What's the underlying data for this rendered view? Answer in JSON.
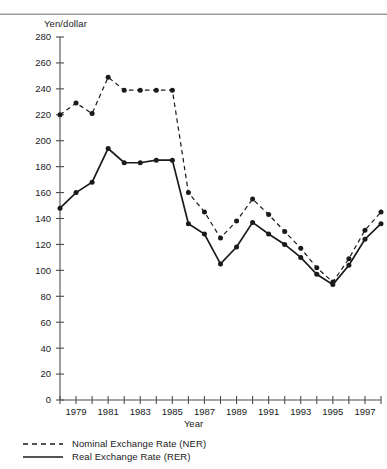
{
  "axes": {
    "ylabel": "Yen/dollar",
    "xlabel": "Year",
    "yticks": [
      "280",
      "260",
      "240",
      "220",
      "200",
      "180",
      "160",
      "140",
      "120",
      "100",
      "80",
      "60",
      "40",
      "20",
      "0"
    ],
    "xticks": [
      "1979",
      "1981",
      "1983",
      "1985",
      "1987",
      "1989",
      "1991",
      "1993",
      "1995",
      "1997"
    ]
  },
  "legend": {
    "items": [
      {
        "label": "Nominal Exchange Rate (NER)",
        "style": "dashed",
        "color": "#1a1a1a"
      },
      {
        "label": "Real Exchange Rate (RER)",
        "style": "solid",
        "color": "#1a1a1a"
      }
    ]
  },
  "chart_data": {
    "type": "line",
    "title": "",
    "xlabel": "Year",
    "ylabel": "Yen/dollar",
    "xlim": [
      1978,
      1998
    ],
    "ylim": [
      0,
      280
    ],
    "ytick_step": 20,
    "xtick_step": 1,
    "xtick_labels_every": 2,
    "grid": false,
    "legend_position": "bottom-left",
    "x": [
      1978,
      1979,
      1980,
      1981,
      1982,
      1983,
      1984,
      1985,
      1986,
      1987,
      1988,
      1989,
      1990,
      1991,
      1992,
      1993,
      1994,
      1995,
      1996,
      1997,
      1998
    ],
    "series": [
      {
        "name": "Nominal Exchange Rate (NER)",
        "style": "dashed",
        "color": "#1a1a1a",
        "values": [
          220,
          229,
          221,
          249,
          239,
          239,
          239,
          239,
          160,
          145,
          125,
          138,
          155,
          143,
          130,
          117,
          102,
          91,
          109,
          131,
          145
        ]
      },
      {
        "name": "Real Exchange Rate (RER)",
        "style": "solid",
        "color": "#1a1a1a",
        "values": [
          148,
          160,
          168,
          194,
          183,
          183,
          185,
          185,
          136,
          128,
          105,
          118,
          137,
          128,
          120,
          110,
          97,
          89,
          104,
          124,
          136
        ]
      }
    ]
  }
}
